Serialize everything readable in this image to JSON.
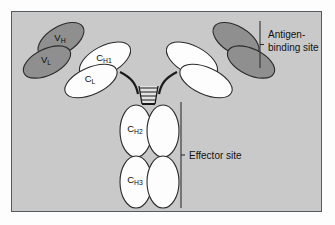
{
  "figure": {
    "background_color": "#c9c9c9",
    "frame_border_color": "#555a5e",
    "page_color": "#fdfdfd"
  },
  "palette": {
    "variable_domain_fill": "#8f8f8f",
    "constant_domain_fill": "#fdfdfd",
    "outline": "#2b2b2b",
    "hinge_line": "#1a1a1a",
    "bracket_line": "#303030",
    "label_text": "#0c0c0c"
  },
  "domains": {
    "heavy_variable": {
      "base": "V",
      "sub": "H",
      "fill_role": "variable",
      "chain": "heavy",
      "arm": "left"
    },
    "light_variable": {
      "base": "V",
      "sub": "L",
      "fill_role": "variable",
      "chain": "light",
      "arm": "left"
    },
    "heavy_constant_1": {
      "base": "C",
      "sub": "H1",
      "fill_role": "constant",
      "chain": "heavy",
      "arm": "left"
    },
    "light_constant": {
      "base": "C",
      "sub": "L",
      "fill_role": "constant",
      "chain": "light",
      "arm": "left"
    },
    "heavy_constant_2": {
      "base": "C",
      "sub": "H2",
      "fill_role": "constant",
      "chain": "heavy",
      "arm": "fc"
    },
    "heavy_constant_3": {
      "base": "C",
      "sub": "H3",
      "fill_role": "constant",
      "chain": "heavy",
      "arm": "fc"
    }
  },
  "unlabeled_domains": {
    "right_arm_variable_count": 2,
    "right_arm_constant_count": 2,
    "fc_right_constant_count": 2
  },
  "hinge": {
    "disulfide_bond_count": 5,
    "description": "inter-heavy-chain disulfide bonds"
  },
  "callouts": [
    {
      "id": "antigen-binding-site",
      "line1": "Antigen-",
      "line2": "binding site",
      "full": "Antigen-binding site",
      "bracket": "vertical"
    },
    {
      "id": "effector-site",
      "line1": "Effector site",
      "line2": "",
      "full": "Effector site",
      "bracket": "vertical"
    }
  ]
}
